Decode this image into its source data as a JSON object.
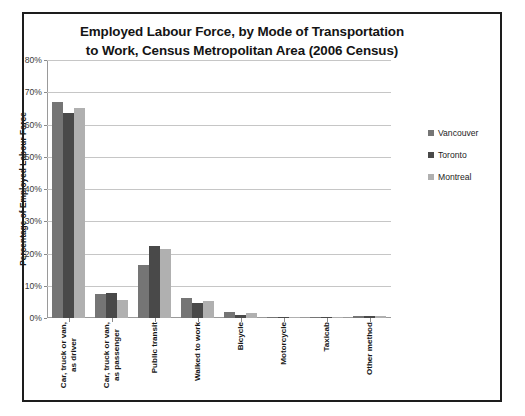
{
  "top_remnant": "·   ·  ·",
  "chart_data": {
    "type": "bar",
    "title": "Employed Labour Force, by Mode of Transportation to Work, Census Metropolitan Area (2006 Census)",
    "title_line1": "Employed Labour Force, by Mode of Transportation",
    "title_line2": "to Work, Census Metropolitan Area (2006 Census)",
    "xlabel": "",
    "ylabel": "Percentage of Employed Labour Force",
    "ylim": [
      0,
      80
    ],
    "ytick_labels": [
      "80%",
      "70%",
      "60%",
      "50%",
      "40%",
      "30%",
      "20%",
      "10%",
      "0%"
    ],
    "ytick_values": [
      80,
      70,
      60,
      50,
      40,
      30,
      20,
      10,
      0
    ],
    "grid": true,
    "legend_position": "right",
    "categories": [
      "Car, truck or van,\nas driver",
      "Car, truck or van,\nas passenger",
      "Public transit",
      "Walked to work",
      "Bicycle",
      "Motorcycle",
      "Taxicab",
      "Other method"
    ],
    "series": [
      {
        "name": "Vancouver",
        "color": "#757575",
        "values": [
          67.0,
          7.3,
          16.5,
          6.2,
          1.8,
          0.2,
          0.2,
          0.7
        ]
      },
      {
        "name": "Toronto",
        "color": "#494949",
        "values": [
          63.5,
          7.7,
          22.2,
          4.8,
          1.0,
          0.2,
          0.4,
          0.7
        ]
      },
      {
        "name": "Montreal",
        "color": "#b0b0b0",
        "values": [
          65.0,
          5.5,
          21.4,
          5.4,
          1.5,
          0.2,
          0.3,
          0.7
        ]
      }
    ]
  },
  "legend": {
    "items": [
      {
        "label": "Vancouver"
      },
      {
        "label": "Toronto"
      },
      {
        "label": "Montreal"
      }
    ]
  }
}
